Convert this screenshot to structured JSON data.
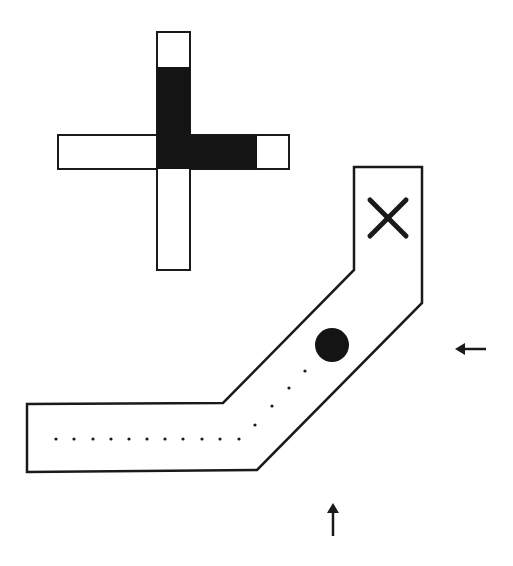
{
  "diagram": {
    "canvas": {
      "width": 513,
      "height": 566,
      "background": "#ffffff"
    },
    "colors": {
      "stroke": "#1a1a1a",
      "fill": "#141414"
    },
    "cross_indicator": {
      "vertical_bar": {
        "x": 157,
        "y": 32,
        "w": 33,
        "h": 238
      },
      "horizontal_bar": {
        "x": 58,
        "y": 135,
        "w": 231,
        "h": 34
      },
      "filled_up_segment": {
        "x": 157,
        "y": 67,
        "w": 33,
        "h": 102
      },
      "filled_right_segment": {
        "x": 157,
        "y": 135,
        "w": 100,
        "h": 34
      }
    },
    "corridor": {
      "points": "354,167 422,167 422,303 257,470 27,472 27,404 223,403 354,270"
    },
    "goal_marker": {
      "symbol": "x-mark",
      "cx": 388,
      "cy": 218,
      "size": 36
    },
    "ball": {
      "cx": 332,
      "cy": 345,
      "r": 17
    },
    "trail_dots": [
      [
        56,
        439
      ],
      [
        74,
        439
      ],
      [
        93,
        439
      ],
      [
        111,
        439
      ],
      [
        129,
        439
      ],
      [
        147,
        439
      ],
      [
        165,
        439
      ],
      [
        183,
        439
      ],
      [
        202,
        439
      ],
      [
        220,
        439
      ],
      [
        239,
        439
      ],
      [
        255,
        425
      ],
      [
        272,
        406
      ],
      [
        289,
        388
      ],
      [
        305,
        371
      ]
    ],
    "arrows": [
      {
        "name": "left-arrow",
        "direction": "left",
        "x1": 486,
        "y1": 349,
        "x2": 455,
        "y2": 349
      },
      {
        "name": "up-arrow",
        "direction": "up",
        "x1": 333,
        "y1": 536,
        "x2": 333,
        "y2": 503
      }
    ]
  }
}
